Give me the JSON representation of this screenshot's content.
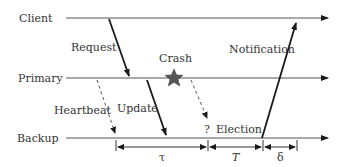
{
  "diagram": {
    "lanes": [
      {
        "id": "client",
        "label": "Client",
        "y": 18
      },
      {
        "id": "primary",
        "label": "Primary",
        "y": 78
      },
      {
        "id": "backup",
        "label": "Backup",
        "y": 138
      }
    ],
    "messages": {
      "request": "Request",
      "update": "Update",
      "heartbeat": "Heartbeat",
      "notification": "Notification",
      "election": "Election",
      "question": "?"
    },
    "events": {
      "crash": "Crash"
    },
    "intervals": {
      "tau": "τ",
      "T": "T",
      "delta": "δ"
    },
    "colors": {
      "line": "#555555",
      "arrow": "#1a1a1a",
      "star": "#555555"
    }
  }
}
